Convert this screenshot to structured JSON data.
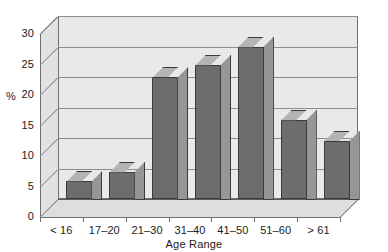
{
  "chart_data": {
    "type": "bar",
    "title": "",
    "subtitle": "",
    "xlabel": "Age Range",
    "ylabel": "%",
    "categories": [
      "< 16",
      "17–20",
      "21–30",
      "31–40",
      "41–50",
      "51–60",
      "> 61"
    ],
    "values": [
      3,
      4.5,
      20,
      22,
      25,
      13,
      9.5
    ],
    "ylim": [
      0,
      30
    ],
    "ytick_labels": [
      "0",
      "5",
      "10",
      "15",
      "20",
      "25",
      "30"
    ],
    "ytick_values": [
      0,
      5,
      10,
      15,
      20,
      25,
      30
    ],
    "grid": true,
    "legend": "none",
    "style": "3d-bars-grayscale",
    "colors": {
      "bar_front": "#6d6d6d",
      "bar_top": "#b4b4b4",
      "bar_side": "#969696",
      "bar_outline": "#3b3b3b",
      "plot_background": "#e9e9e9",
      "wall": "#e2e2e2",
      "floor": "#dedede",
      "gridline": "#8d8d8d",
      "axis": "#5c5c5c",
      "text": "#1a1a1a",
      "page_background": "#ffffff"
    }
  }
}
